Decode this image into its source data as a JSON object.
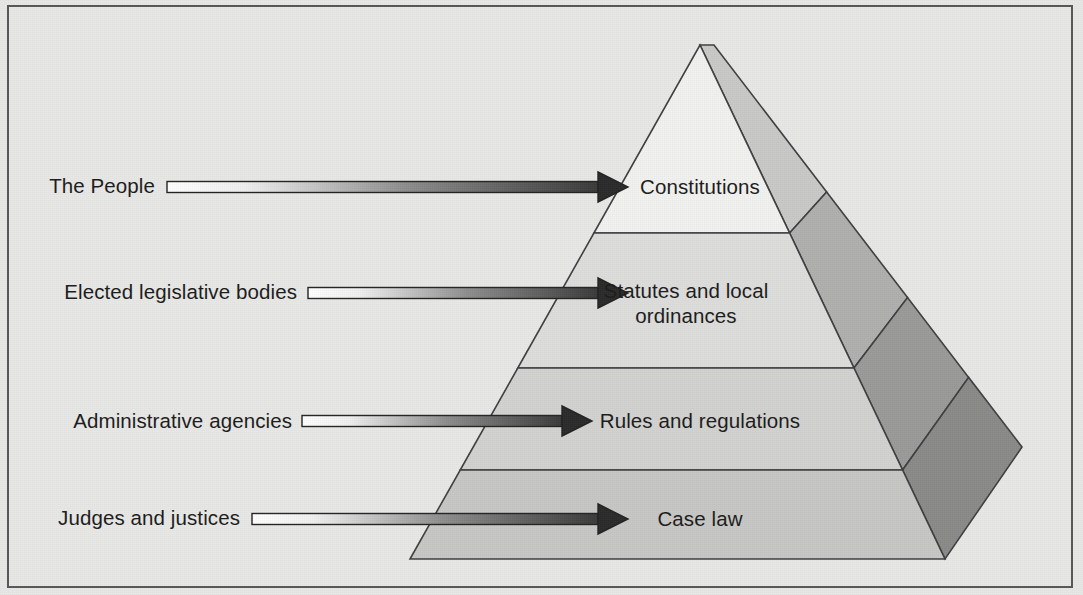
{
  "diagram": {
    "type": "pyramid-diagram",
    "background_color": "#e8e8e6",
    "frame_color": "#58585a"
  },
  "sources": [
    {
      "id": "source-the-people",
      "label": "The People",
      "label_x": 155,
      "label_y": 173,
      "arrow_y": 187,
      "arrow_x1": 167,
      "arrow_x2": 628
    },
    {
      "id": "source-legislative-bodies",
      "label": "Elected legislative bodies",
      "label_x": 297,
      "label_y": 279,
      "arrow_y": 293,
      "arrow_x1": 308,
      "arrow_x2": 628
    },
    {
      "id": "source-administrative-agencies",
      "label": "Administrative agencies",
      "label_x": 292,
      "label_y": 408,
      "arrow_y": 421,
      "arrow_x1": 302,
      "arrow_x2": 592
    },
    {
      "id": "source-judges-justices",
      "label": "Judges and justices",
      "label_x": 240,
      "label_y": 505,
      "arrow_y": 519,
      "arrow_x1": 252,
      "arrow_x2": 628
    }
  ],
  "tiers": [
    {
      "id": "tier-constitutions",
      "label": "Constitutions",
      "lines": [
        "Constitutions"
      ],
      "front_color": "#f2f2f0",
      "side_color": "#c9c9c7",
      "text_x": 700,
      "text_y": 174
    },
    {
      "id": "tier-statutes",
      "label": "Statutes and local ordinances",
      "lines": [
        "Statutes and local",
        "ordinances"
      ],
      "front_color": "#dddddb",
      "side_color": "#b0b0ae",
      "text_x": 686,
      "text_y": 278
    },
    {
      "id": "tier-rules",
      "label": "Rules and regulations",
      "lines": [
        "Rules and regulations"
      ],
      "front_color": "#d2d2d0",
      "side_color": "#9a9a98",
      "text_x": 700,
      "text_y": 408
    },
    {
      "id": "tier-case-law",
      "label": "Case law",
      "lines": [
        "Case law"
      ],
      "front_color": "#c7c7c5",
      "side_color": "#8a8a88",
      "text_x": 700,
      "text_y": 506
    }
  ],
  "geometry": {
    "apex_x": 700,
    "apex_y": 45,
    "base_left_x": 410,
    "base_right_x": 945,
    "base_y": 559,
    "back_apex_offset_x": 14,
    "side_right_x": 1022,
    "side_right_y": 447,
    "divider_y": [
      233,
      368,
      470
    ]
  },
  "arrow": {
    "gradient_from": "#ffffff",
    "gradient_to": "#3a3a3a",
    "outline_color": "#232323",
    "head_color": "#2b2b2b",
    "shaft_height": 11,
    "head_length": 30,
    "head_height": 30
  }
}
